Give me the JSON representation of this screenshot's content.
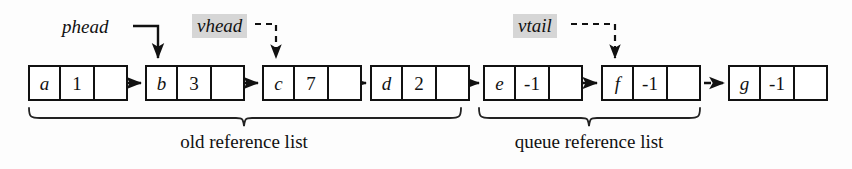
{
  "figure": {
    "background_color": "#fdfdfd",
    "ink_color": "#111111",
    "highlight_color": "#d6d6d6"
  },
  "nodes": [
    {
      "id": "node-a",
      "key": "a",
      "value": "1",
      "pointer": "",
      "x": 28,
      "y": 65
    },
    {
      "id": "node-b",
      "key": "b",
      "value": "3",
      "pointer": "",
      "x": 145,
      "y": 65
    },
    {
      "id": "node-c",
      "key": "c",
      "value": "7",
      "pointer": "",
      "x": 262,
      "y": 65
    },
    {
      "id": "node-d",
      "key": "d",
      "value": "2",
      "pointer": "",
      "x": 370,
      "y": 65
    },
    {
      "id": "node-e",
      "key": "e",
      "value": "-1",
      "pointer": "",
      "x": 483,
      "y": 65
    },
    {
      "id": "node-f",
      "key": "f",
      "value": "-1",
      "pointer": "",
      "x": 601,
      "y": 65
    },
    {
      "id": "node-g",
      "key": "g",
      "value": "-1",
      "pointer": "",
      "x": 728,
      "y": 65
    }
  ],
  "pointers": [
    {
      "id": "phead",
      "label": "phead",
      "style": "solid",
      "highlighted": false,
      "target": "node-b",
      "x": 62,
      "y": 18
    },
    {
      "id": "vhead",
      "label": "vhead",
      "style": "dashed",
      "highlighted": true,
      "target": "node-c",
      "x": 194,
      "y": 16
    },
    {
      "id": "vtail",
      "label": "vtail",
      "style": "dashed",
      "highlighted": true,
      "target": "node-f",
      "x": 515,
      "y": 16
    }
  ],
  "groups": [
    {
      "id": "group-old",
      "caption": "old reference list",
      "from_x": 28,
      "to_x": 461,
      "caption_center_x": 244,
      "caption_y": 134
    },
    {
      "id": "group-queue",
      "caption": "queue reference list",
      "from_x": 478,
      "to_x": 700,
      "caption_center_x": 589,
      "caption_y": 134
    }
  ],
  "links": [
    {
      "from": "node-a",
      "to": "node-b",
      "style": "solid"
    },
    {
      "from": "node-b",
      "to": "node-c",
      "style": "solid"
    },
    {
      "from": "node-c",
      "to": "node-d",
      "style": "solid"
    },
    {
      "from": "node-d",
      "to": "node-e",
      "style": "solid"
    },
    {
      "from": "node-e",
      "to": "node-f",
      "style": "solid"
    },
    {
      "from": "node-f",
      "to": "node-g",
      "style": "dashed"
    }
  ]
}
